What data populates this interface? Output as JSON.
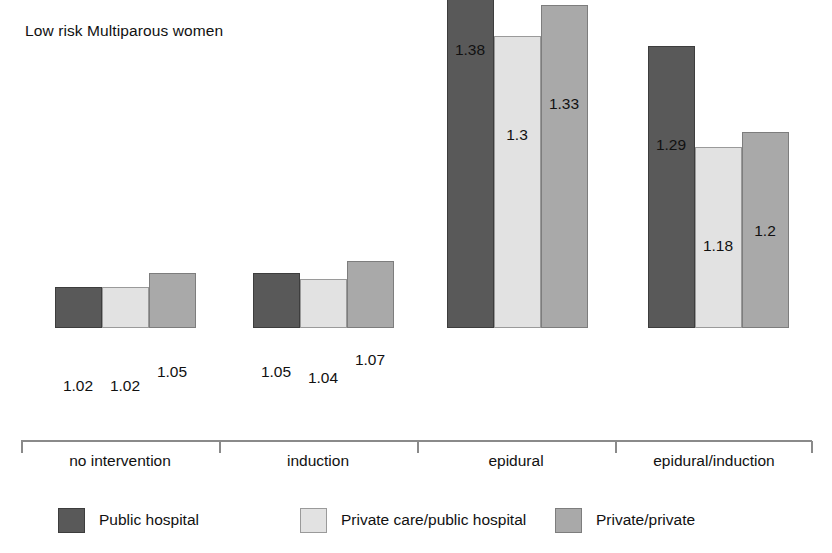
{
  "chart_data": {
    "type": "bar",
    "title": "Low risk Multiparous women",
    "xlabel": "",
    "ylabel": "",
    "ylim": [
      1.0,
      1.42
    ],
    "grid": false,
    "legend_position": "bottom",
    "categories": [
      "no intervention",
      "induction",
      "epidural",
      "epidural/induction"
    ],
    "series": [
      {
        "name": "Public hospital",
        "color": "#595959",
        "values": [
          1.02,
          1.05,
          1.38,
          1.29
        ],
        "labels": [
          "1.02",
          "1.05",
          "1.38",
          "1.29"
        ]
      },
      {
        "name": "Private care/public hospital",
        "color": "#e2e2e2",
        "values": [
          1.02,
          1.04,
          1.3,
          1.18
        ],
        "labels": [
          "1.02",
          "1.04",
          "1.3",
          "1.18"
        ]
      },
      {
        "name": "Private/private",
        "color": "#a9a9a9",
        "values": [
          1.05,
          1.07,
          1.33,
          1.2
        ],
        "labels": [
          "1.05",
          "1.07",
          "1.33",
          "1.2"
        ]
      }
    ]
  },
  "layout": {
    "bars": [
      {
        "x": 55,
        "top": 399,
        "series": 0,
        "group": 0,
        "label": "1.02",
        "label_x": 48,
        "label_y": 377
      },
      {
        "x": 102,
        "top": 399,
        "series": 1,
        "group": 0,
        "label": "1.02",
        "label_x": 95,
        "label_y": 377
      },
      {
        "x": 149,
        "top": 385,
        "series": 2,
        "group": 0,
        "label": "1.05",
        "label_x": 142,
        "label_y": 363
      },
      {
        "x": 253,
        "top": 385,
        "series": 0,
        "group": 1,
        "label": "1.05",
        "label_x": 246,
        "label_y": 363
      },
      {
        "x": 300,
        "top": 391,
        "series": 1,
        "group": 1,
        "label": "1.04",
        "label_x": 293,
        "label_y": 369
      },
      {
        "x": 347,
        "top": 373,
        "series": 2,
        "group": 1,
        "label": "1.07",
        "label_x": 340,
        "label_y": 351
      },
      {
        "x": 447,
        "top": 63,
        "series": 0,
        "group": 2,
        "label": "1.38",
        "label_x": 440,
        "label_y": 41
      },
      {
        "x": 494,
        "top": 148,
        "series": 1,
        "group": 2,
        "label": "1.3",
        "label_x": 487,
        "label_y": 126
      },
      {
        "x": 541,
        "top": 117,
        "series": 2,
        "group": 2,
        "label": "1.33",
        "label_x": 534,
        "label_y": 95
      },
      {
        "x": 648,
        "top": 158,
        "series": 0,
        "group": 3,
        "label": "1.29",
        "label_x": 641,
        "label_y": 136
      },
      {
        "x": 695,
        "top": 259,
        "series": 1,
        "group": 3,
        "label": "1.18",
        "label_x": 688,
        "label_y": 237
      },
      {
        "x": 742,
        "top": 244,
        "series": 2,
        "group": 3,
        "label": "1.2",
        "label_x": 735,
        "label_y": 222
      }
    ],
    "ticks_x": [
      21,
      219,
      417,
      615,
      811
    ],
    "cat_label_x": [
      120,
      318,
      516,
      714
    ],
    "legend_items_x": [
      58,
      300,
      555
    ]
  }
}
